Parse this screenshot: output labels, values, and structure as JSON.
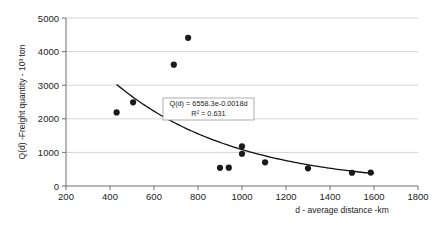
{
  "chart_data": {
    "type": "scatter",
    "title": "",
    "xlabel": "d - average distance -km",
    "ylabel": "Q(d) -Freight quantity - 10³ ton",
    "xlim": [
      200,
      1800
    ],
    "ylim": [
      0,
      5000
    ],
    "xticks": [
      200,
      400,
      600,
      800,
      1000,
      1200,
      1400,
      1600,
      1800
    ],
    "yticks": [
      0,
      1000,
      2000,
      3000,
      4000,
      5000
    ],
    "xtick_labels": [
      "200",
      "400",
      "600",
      "800",
      "1000",
      "1200",
      "1400",
      "1600",
      "1800"
    ],
    "ytick_labels": [
      "0",
      "1000",
      "2000",
      "3000",
      "4000",
      "5000"
    ],
    "grid": "horizontal",
    "legend": "none",
    "marker_color": "#1a1a1a",
    "trendline_color": "#111111",
    "gridline_color": "#c9c9c9",
    "axis_color": "#6f6f6f",
    "points": [
      {
        "x": 430,
        "y": 2190
      },
      {
        "x": 505,
        "y": 2490
      },
      {
        "x": 690,
        "y": 3610
      },
      {
        "x": 755,
        "y": 4410
      },
      {
        "x": 900,
        "y": 540
      },
      {
        "x": 940,
        "y": 545
      },
      {
        "x": 1000,
        "y": 1180
      },
      {
        "x": 1000,
        "y": 960
      },
      {
        "x": 1105,
        "y": 705
      },
      {
        "x": 1300,
        "y": 525
      },
      {
        "x": 1500,
        "y": 395
      },
      {
        "x": 1585,
        "y": 400
      }
    ],
    "trendline": {
      "type": "exponential",
      "coefficient": 6558.3,
      "exponent": -0.0018,
      "x_start": 430,
      "x_end": 1600,
      "r_squared": 0.631
    },
    "annotations": {
      "equation": "Q(d) = 6558.3e-0.0018d",
      "r_squared_label": "R² = 0.631"
    }
  }
}
